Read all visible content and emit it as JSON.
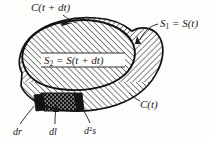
{
  "figure": {
    "background_color": "#fdfdfc",
    "ink_color": "#1b1b1b",
    "labels": {
      "curve_outer": "C(t + dt)",
      "surface_1": "S",
      "surface_1_sub": "1",
      "surface_1_eq": " = S(t)",
      "surface_2": "S",
      "surface_2_sub": "2",
      "surface_2_eq": " = S(t + dt)",
      "curve_inner": "C(t)",
      "element_dr": "dr",
      "element_dl": "dl",
      "element_d2s": "d",
      "element_d2s_sup": "2",
      "element_d2s_tail": "s"
    },
    "colors": {
      "hatch": "#1b1b1b",
      "outline": "#111111",
      "stipple_fill": "#141414",
      "stipple_dots": "#ffffff"
    },
    "geometry": {
      "hatch_spacing_px": 4,
      "hatch_angle_upper_deg": 45,
      "hatch_angle_right_lobe_deg": -45
    }
  }
}
